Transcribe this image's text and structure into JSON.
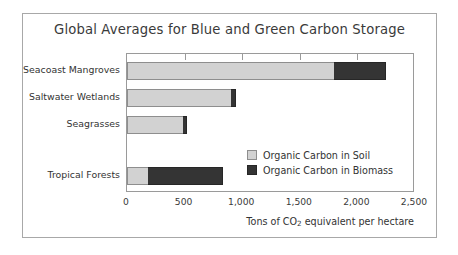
{
  "chart_data": {
    "type": "bar",
    "orientation": "horizontal",
    "stacked": true,
    "title": "Global Averages for Blue and Green Carbon Storage",
    "xlabel": "Tons of CO2 equivalent per hectare",
    "xlabel_parts": {
      "pre": "Tons of CO",
      "sub": "2",
      "post": " equivalent per hectare"
    },
    "ylabel": "",
    "categories": [
      "Seacoast Mangroves",
      "Saltwater Wetlands",
      "Seagrasses",
      "Tropical Forests"
    ],
    "series": [
      {
        "name": "Organic Carbon in Soil",
        "color": "#d2d2d2",
        "values": [
          1800,
          900,
          490,
          180
        ]
      },
      {
        "name": "Organic Carbon in Biomass",
        "color": "#343434",
        "values": [
          450,
          50,
          30,
          650
        ]
      }
    ],
    "totals": [
      2250,
      950,
      520,
      830
    ],
    "xlim": [
      0,
      2500
    ],
    "xticks": [
      0,
      500,
      1000,
      1500,
      2000,
      2500
    ],
    "xticklabels": [
      "0",
      "500",
      "1,000",
      "1,500",
      "2,000",
      "2,500"
    ],
    "grid": false,
    "legend_position": "inside-lower-right",
    "category_row_tops": [
      8,
      35,
      62,
      113
    ],
    "bar_thickness_px": 18
  },
  "legend": {
    "items": [
      {
        "label": "Organic Carbon in Soil",
        "swatch": "swatch-soil"
      },
      {
        "label": "Organic Carbon in Biomass",
        "swatch": "swatch-bio"
      }
    ]
  },
  "colors": {
    "soil": "#d2d2d2",
    "biomass": "#343434",
    "frame": "#9a9a9a",
    "card_border": "#a8a8a8",
    "text": "#333333",
    "background": "#ffffff"
  }
}
